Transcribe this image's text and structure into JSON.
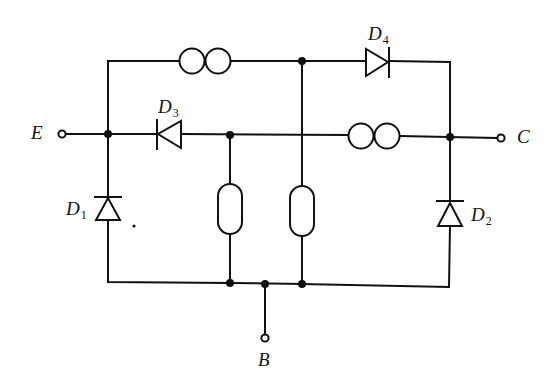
{
  "diagram": {
    "type": "circuit-schematic",
    "colors": {
      "line": "#111111",
      "background": "#ffffff"
    },
    "terminals": [
      {
        "id": "E",
        "label": "E"
      },
      {
        "id": "C",
        "label": "C"
      },
      {
        "id": "B",
        "label": "B"
      }
    ],
    "diodes": [
      {
        "id": "D1",
        "label": "D",
        "sub": "1"
      },
      {
        "id": "D2",
        "label": "D",
        "sub": "2"
      },
      {
        "id": "D3",
        "label": "D",
        "sub": "3"
      },
      {
        "id": "D4",
        "label": "D",
        "sub": "4"
      }
    ],
    "components": {
      "inductors": [
        "top-branch-inductor",
        "middle-branch-inductor"
      ],
      "resistors": [
        "left-resistor",
        "right-resistor"
      ]
    },
    "stray_mark": "."
  }
}
